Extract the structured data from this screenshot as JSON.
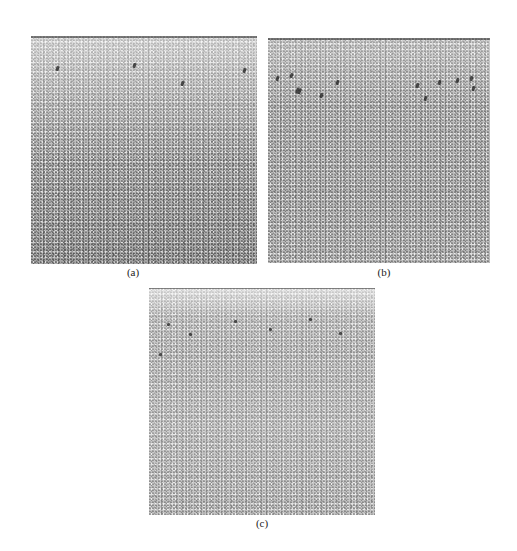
{
  "figure": {
    "panels": [
      {
        "id": "a",
        "label": "(a)",
        "description": "grayscale micrograph, lighter top region with scattered dark marks"
      },
      {
        "id": "b",
        "label": "(b)",
        "description": "grayscale micrograph, row of dark marks near top"
      },
      {
        "id": "c",
        "label": "(c)",
        "description": "grayscale micrograph, lighter overall with band of marks near top"
      }
    ]
  },
  "colors": {
    "background": "#ffffff",
    "texture_mid": "#b4b4b4",
    "label_text": "#222222"
  }
}
